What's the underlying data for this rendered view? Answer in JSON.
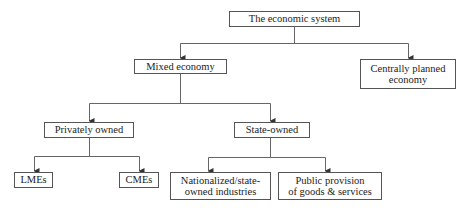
{
  "diagram": {
    "type": "hierarchy",
    "root": {
      "label": "The economic system",
      "children": [
        {
          "label": "Mixed economy",
          "children": [
            {
              "label": "Privately owned",
              "children": [
                {
                  "label": "LMEs"
                },
                {
                  "label": "CMEs"
                }
              ]
            },
            {
              "label": "State-owned",
              "children": [
                {
                  "label_lines": [
                    "Nationalized/state-",
                    "owned industries"
                  ]
                },
                {
                  "label_lines": [
                    "Public provision",
                    "of goods & services"
                  ]
                }
              ]
            }
          ]
        },
        {
          "label_lines": [
            "Centrally planned",
            "economy"
          ]
        }
      ]
    }
  },
  "nodes": {
    "economic_system": "The economic system",
    "mixed_economy": "Mixed economy",
    "centrally_planned": [
      "Centrally planned",
      "economy"
    ],
    "privately_owned": "Privately owned",
    "state_owned": "State-owned",
    "lmes": "LMEs",
    "cmes": "CMEs",
    "nationalized": [
      "Nationalized/state-",
      "owned industries"
    ],
    "public_provision": [
      "Public provision",
      "of goods & services"
    ]
  },
  "colors": {
    "line": "#555555",
    "text": "#222222",
    "background": "#ffffff"
  }
}
